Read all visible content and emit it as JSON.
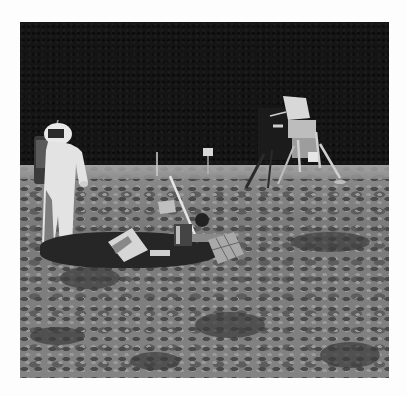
{
  "image": {
    "description": "Black-and-white photograph of an astronaut standing on the lunar surface beside a deployed scientific experiment package, with the lunar module in the background against a black sky",
    "frame": {
      "left": 20,
      "top": 22,
      "width": 369,
      "height": 356
    },
    "colors": {
      "page_background": "#fdfdfd",
      "sky": "#151515",
      "lunar_surface": "#838383",
      "shadow": "#262626",
      "suit": "#e6e6e6"
    },
    "elements": [
      {
        "name": "astronaut",
        "position": "left"
      },
      {
        "name": "lunar-module",
        "position": "upper-right"
      },
      {
        "name": "scientific-experiment-package",
        "position": "center"
      },
      {
        "name": "solar-panel",
        "position": "center-right"
      },
      {
        "name": "flag-pole",
        "position": "horizon-center"
      },
      {
        "name": "tv-camera",
        "position": "horizon-center"
      }
    ]
  }
}
